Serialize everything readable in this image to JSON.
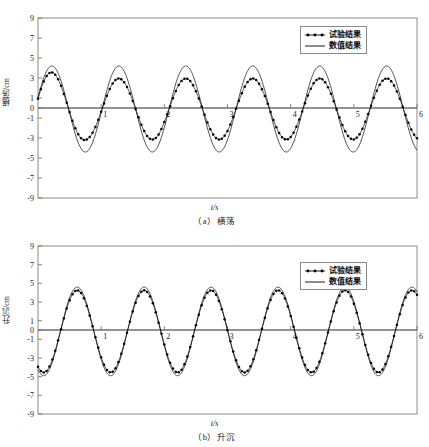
{
  "figure": {
    "panels": [
      {
        "id": "a",
        "caption": "（a）横荡",
        "xlabel": "t/s",
        "ylabel": "横荡/cm",
        "legend": [
          {
            "label": "试验结果",
            "style": "line-markers"
          },
          {
            "label": "数值结果",
            "style": "line"
          }
        ]
      },
      {
        "id": "b",
        "caption": "（b）升沉",
        "xlabel": "t/s",
        "ylabel": "升沉/cm",
        "legend": [
          {
            "label": "试验结果",
            "style": "line-markers"
          },
          {
            "label": "数值结果",
            "style": "line"
          }
        ]
      }
    ]
  },
  "chart_data": [
    {
      "type": "line",
      "panel": "a",
      "title": "（a）横荡",
      "xlabel": "t/s",
      "ylabel": "横荡/cm",
      "xlim": [
        0,
        6
      ],
      "ylim": [
        -9,
        9
      ],
      "xticks": [
        0,
        1,
        2,
        3,
        4,
        5,
        6
      ],
      "xticklabels": [
        "",
        "1",
        "2",
        "3",
        "4",
        "5",
        "6"
      ],
      "yticks": [
        -9,
        -7,
        -5,
        -3,
        -1,
        0,
        1,
        3,
        5,
        7,
        9
      ],
      "yticklabels": [
        "-9",
        "-7",
        "-5",
        "-3",
        "-1",
        "0",
        "1",
        "3",
        "5",
        "7",
        "9"
      ],
      "grid": false,
      "legend_position": "top-right",
      "series": [
        {
          "name": "试验结果",
          "marker": "dot",
          "color": "#000000",
          "period": 1.06,
          "amplitude": 3.05,
          "phase_offset": 0.22,
          "first_peak_amplitude": 3.9,
          "mean": -0.1
        },
        {
          "name": "数值结果",
          "marker": "none",
          "color": "#000000",
          "period": 1.06,
          "amplitude": 4.3,
          "phase_offset": 0.22,
          "mean": -0.1
        }
      ]
    },
    {
      "type": "line",
      "panel": "b",
      "title": "（b）升沉",
      "xlabel": "t/s",
      "ylabel": "升沉/cm",
      "xlim": [
        0,
        6
      ],
      "ylim": [
        -9,
        9
      ],
      "xticks": [
        0,
        1,
        2,
        3,
        4,
        5,
        6
      ],
      "xticklabels": [
        "",
        "1",
        "2",
        "3",
        "4",
        "5",
        "6"
      ],
      "yticks": [
        -9,
        -7,
        -5,
        -3,
        -1,
        0,
        1,
        3,
        5,
        7,
        9
      ],
      "yticklabels": [
        "-9",
        "-7",
        "-5",
        "-3",
        "-1",
        "0",
        "1",
        "3",
        "5",
        "7",
        "9"
      ],
      "grid": false,
      "legend_position": "top-right",
      "series": [
        {
          "name": "试验结果",
          "marker": "dot",
          "color": "#000000",
          "period": 1.06,
          "amplitude": 4.4,
          "phase_offset": 0.62,
          "mean": -0.15
        },
        {
          "name": "数值结果",
          "marker": "none",
          "color": "#000000",
          "period": 1.06,
          "amplitude": 4.75,
          "phase_offset": 0.62,
          "mean": -0.15
        }
      ]
    }
  ]
}
